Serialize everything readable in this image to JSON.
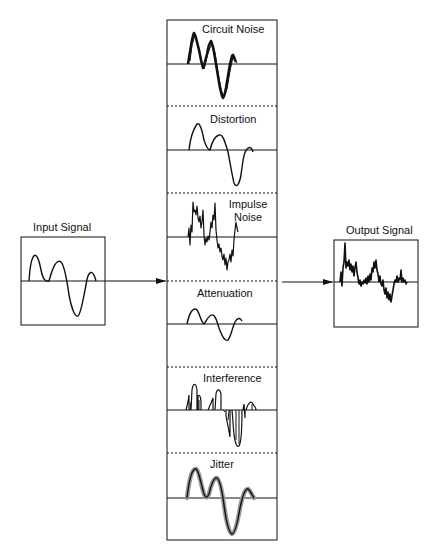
{
  "diagram": {
    "type": "signal-impairments-block-diagram",
    "input": {
      "label": "Input Signal"
    },
    "output": {
      "label": "Output Signal"
    },
    "impairments": [
      {
        "label_line1": "Circuit Noise",
        "label_line2": ""
      },
      {
        "label_line1": "Distortion",
        "label_line2": ""
      },
      {
        "label_line1": "Impulse",
        "label_line2": "Noise"
      },
      {
        "label_line1": "Attenuation",
        "label_line2": ""
      },
      {
        "label_line1": "Interference",
        "label_line2": ""
      },
      {
        "label_line1": "Jitter",
        "label_line2": ""
      }
    ],
    "colors": {
      "stroke": "#111111",
      "jitter_halo": "#9a9a9a",
      "background": "#ffffff"
    }
  }
}
